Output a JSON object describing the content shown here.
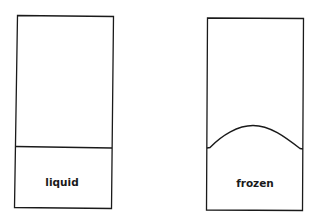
{
  "diagram": {
    "containers": [
      {
        "id": "liquid-container",
        "label": "liquid",
        "surface": "flat"
      },
      {
        "id": "frozen-container",
        "label": "frozen",
        "surface": "domed"
      }
    ],
    "colors": {
      "stroke": "#1a1a1a",
      "background": "#ffffff"
    }
  }
}
